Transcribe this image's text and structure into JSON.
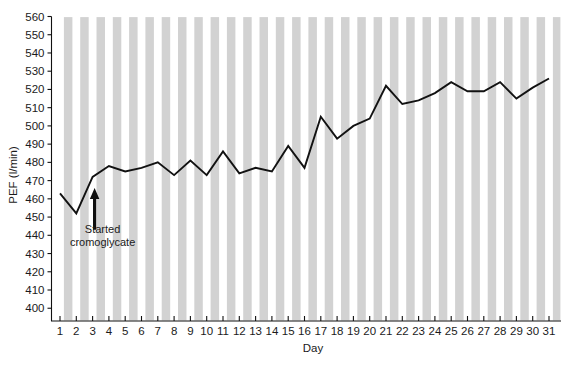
{
  "chart_data": {
    "type": "line",
    "title": "",
    "xlabel": "Day",
    "ylabel": "PEF (l/min)",
    "xlim": [
      1,
      31
    ],
    "ylim": [
      393,
      560
    ],
    "grid": "vertical-bands",
    "legend": "none",
    "x": [
      1,
      2,
      3,
      4,
      5,
      6,
      7,
      8,
      9,
      10,
      11,
      12,
      13,
      14,
      15,
      16,
      17,
      18,
      19,
      20,
      21,
      22,
      23,
      24,
      25,
      26,
      27,
      28,
      29,
      30,
      31
    ],
    "xtick_labels": [
      "1",
      "2",
      "3",
      "4",
      "5",
      "6",
      "7",
      "8",
      "9",
      "10",
      "11",
      "12",
      "13",
      "14",
      "15",
      "16",
      "17",
      "18",
      "19",
      "20",
      "21",
      "22",
      "23",
      "24",
      "25",
      "26",
      "27",
      "28",
      "29",
      "30",
      "31"
    ],
    "ytick_labels": [
      "400",
      "410",
      "420",
      "430",
      "440",
      "450",
      "460",
      "470",
      "480",
      "490",
      "500",
      "510",
      "520",
      "530",
      "540",
      "550",
      "560"
    ],
    "ytick_values": [
      400,
      410,
      420,
      430,
      440,
      450,
      460,
      470,
      480,
      490,
      500,
      510,
      520,
      530,
      540,
      550,
      560
    ],
    "series": [
      {
        "name": "PEF",
        "values": [
          463,
          452,
          472,
          478,
          475,
          477,
          480,
          473,
          481,
          473,
          486,
          474,
          477,
          475,
          489,
          477,
          505,
          493,
          500,
          504,
          522,
          512,
          514,
          518,
          524,
          519,
          519,
          524,
          515,
          521,
          526
        ]
      }
    ],
    "annotations": [
      {
        "name": "started-cromoglycate",
        "text_line1": "Started",
        "text_line2": "cromoglycate",
        "arrow": "up-arrow",
        "at_day": 3,
        "arrow_base_value": 443,
        "arrow_tip_value": 466
      }
    ],
    "colors": {
      "line": "#121212",
      "band": "#d2d2d2",
      "axis": "#111111",
      "background": "#ffffff",
      "text": "#1b1b1b"
    }
  }
}
